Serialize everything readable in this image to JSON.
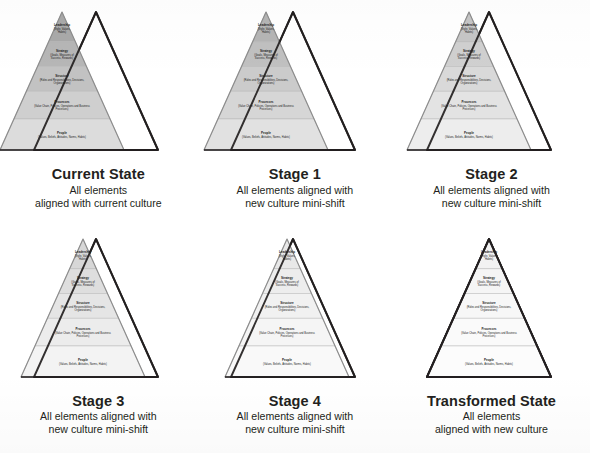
{
  "diagram": {
    "band_label_title_size": 3.0,
    "band_label_sub_size": 2.6,
    "colors": {
      "outline_dark": "#231f20",
      "pyramid_stroke": "#8c8c8c",
      "band_divider": "#b3b3b3",
      "text": "#1a1a1a",
      "background": "#ffffff"
    },
    "bands": [
      {
        "id": "leadership",
        "title": "Leadership",
        "detail": "(Style, Values, Habits)",
        "detail_lines": [
          "(Style, Values,",
          "Habits)"
        ]
      },
      {
        "id": "strategy",
        "title": "Strategy",
        "detail": "(Goals, Measures of Success, Rewards)",
        "detail_lines": [
          "(Goals, Measures of",
          "Success, Rewards)"
        ]
      },
      {
        "id": "structure",
        "title": "Structure",
        "detail": "(Roles and Responsibilities, Decisions, Organizations)",
        "detail_lines": [
          "(Roles and Responsibilities, Decisions,",
          "Organizations)"
        ]
      },
      {
        "id": "processes",
        "title": "Processes",
        "detail": "(Value Chain, Policies, Operations and Business Processes)",
        "detail_lines": [
          "(Value Chain, Policies, Operations and Business",
          "Processes)"
        ]
      },
      {
        "id": "people",
        "title": "People",
        "detail": "(Values, Beliefs, Attitudes, Norms, Habits)",
        "detail_lines": [
          "(Values, Beliefs, Attitudes, Norms, Habits)"
        ]
      }
    ],
    "panels": [
      {
        "id": "current-state",
        "title": "Current State",
        "subtitle_lines": [
          "All elements",
          "aligned with current culture"
        ],
        "pyramid_shift": 0,
        "new_culture_shift": 34,
        "band_fills": [
          "#a9a9a9",
          "#b6b6b6",
          "#c2c2c2",
          "#cfcfcf",
          "#dcdcdc"
        ],
        "merged": false
      },
      {
        "id": "stage-1",
        "title": "Stage 1",
        "subtitle_lines": [
          "All elements aligned with",
          "new culture mini-shift"
        ],
        "pyramid_shift": 7,
        "new_culture_shift": 34,
        "band_fills": [
          "#b5b5b5",
          "#c0c0c0",
          "#cbcbcb",
          "#d6d6d6",
          "#e1e1e1"
        ],
        "merged": false
      },
      {
        "id": "stage-2",
        "title": "Stage 2",
        "subtitle_lines": [
          "All elements aligned with",
          "new culture mini-shift"
        ],
        "pyramid_shift": 14,
        "new_culture_shift": 34,
        "band_fills": [
          "#c6c6c6",
          "#d0d0d0",
          "#d9d9d9",
          "#e3e3e3",
          "#ededed"
        ],
        "merged": false
      },
      {
        "id": "stage-3",
        "title": "Stage 3",
        "subtitle_lines": [
          "All elements aligned with",
          "new culture mini-shift"
        ],
        "pyramid_shift": 21,
        "new_culture_shift": 34,
        "band_fills": [
          "#d7d7d7",
          "#dedede",
          "#e5e5e5",
          "#ececec",
          "#f3f3f3"
        ],
        "merged": false
      },
      {
        "id": "stage-4",
        "title": "Stage 4",
        "subtitle_lines": [
          "All elements aligned with",
          "new culture mini-shift"
        ],
        "pyramid_shift": 28,
        "new_culture_shift": 34,
        "band_fills": [
          "#e8e8e8",
          "#ededed",
          "#f1f1f1",
          "#f5f5f5",
          "#f9f9f9"
        ],
        "merged": false
      },
      {
        "id": "transformed-state",
        "title": "Transformed State",
        "subtitle_lines": [
          "All elements",
          "aligned with new culture"
        ],
        "pyramid_shift": 34,
        "new_culture_shift": 34,
        "band_fills": [
          "#f2f2f2",
          "#f5f5f5",
          "#f7f7f7",
          "#fafafa",
          "#fcfcfc"
        ],
        "merged": true
      }
    ]
  }
}
